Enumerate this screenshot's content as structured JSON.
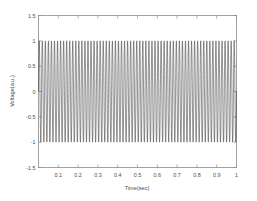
{
  "chart_data": {
    "type": "line",
    "title": "",
    "xlabel": "Time(sec)",
    "ylabel": "Voltage(a.u.)",
    "xlim": [
      0,
      1
    ],
    "ylim": [
      -1.5,
      1.5
    ],
    "grid": false,
    "legend": null,
    "legend_position": "none",
    "xticks": [
      0.1,
      0.2,
      0.3,
      0.4,
      0.5,
      0.6,
      0.7,
      0.8,
      0.9,
      1
    ],
    "xticklabels": [
      "0.1",
      "0.2",
      "0.3",
      "0.4",
      "0.5",
      "0.6",
      "0.7",
      "0.8",
      "0.9",
      "1"
    ],
    "yticks": [
      -1.5,
      -1,
      -0.5,
      0,
      0.5,
      1,
      1.5
    ],
    "yticklabels": [
      "-1.5",
      "-1",
      "-0.5",
      "0",
      "0.5",
      "1",
      "1.5"
    ],
    "series": [
      {
        "name": "voltage",
        "color": "#3a3a3a",
        "linewidth": 0.55,
        "waveform": "sine",
        "amplitude": 1,
        "frequency_hz": 65,
        "phase": 0,
        "offset": 0,
        "x_start": 0,
        "x_end": 1,
        "samples": 4000,
        "description": "Continuous sinusoidal voltage oscillation of unit amplitude spanning 0 to 1 second, rendered so dense that individual cycles appear as closely packed vertical strokes filling the band between -1 and 1."
      }
    ]
  },
  "axes": {
    "x_axis_name": "time-axis",
    "y_axis_name": "voltage-axis",
    "box_visible": true,
    "box_color": "#8c8c8c"
  },
  "figure": {
    "background": "#ffffff",
    "width": 257,
    "height": 201
  }
}
